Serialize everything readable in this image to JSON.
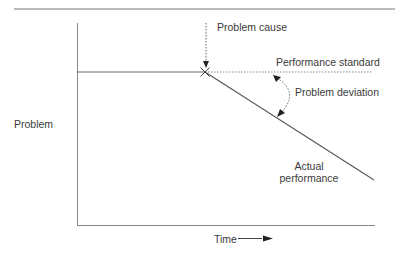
{
  "diagram": {
    "type": "problem-analysis-performance-deviation",
    "labels": {
      "problem_cause": "Problem cause",
      "performance_standard": "Performance standard",
      "problem_deviation": "Problem deviation",
      "actual_performance_line1": "Actual",
      "actual_performance_line2": "performance",
      "y_axis": "Problem",
      "x_axis": "Time"
    },
    "colors": {
      "line": "#555555",
      "text": "#3a3a3a",
      "background": "#ffffff"
    }
  }
}
